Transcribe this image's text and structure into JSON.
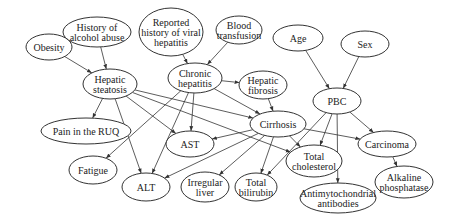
{
  "diagram": {
    "type": "bayesian-network",
    "nodes": [
      {
        "id": "alcohol",
        "lines": [
          "History of",
          "alcohol abuse"
        ],
        "cx": 97,
        "cy": 32,
        "rx": 34,
        "ry": 15
      },
      {
        "id": "obesity",
        "lines": [
          "Obesity"
        ],
        "cx": 49,
        "cy": 47,
        "rx": 23,
        "ry": 13
      },
      {
        "id": "viral",
        "lines": [
          "Reported",
          "history of viral",
          "hepatitis"
        ],
        "cx": 171,
        "cy": 32,
        "rx": 32,
        "ry": 24
      },
      {
        "id": "transfusion",
        "lines": [
          "Blood",
          "transfusion"
        ],
        "cx": 239,
        "cy": 30,
        "rx": 23,
        "ry": 14
      },
      {
        "id": "age",
        "lines": [
          "Age"
        ],
        "cx": 298,
        "cy": 38,
        "rx": 25,
        "ry": 13
      },
      {
        "id": "sex",
        "lines": [
          "Sex"
        ],
        "cx": 365,
        "cy": 44,
        "rx": 24,
        "ry": 13
      },
      {
        "id": "steatosis",
        "lines": [
          "Hepatic",
          "steatosis"
        ],
        "cx": 110,
        "cy": 84,
        "rx": 27,
        "ry": 15
      },
      {
        "id": "chronic",
        "lines": [
          "Chronic",
          "hepatitis"
        ],
        "cx": 195,
        "cy": 78,
        "rx": 27,
        "ry": 15
      },
      {
        "id": "fibrosis",
        "lines": [
          "Hepatic",
          "fibrosis"
        ],
        "cx": 263,
        "cy": 85,
        "rx": 24,
        "ry": 14
      },
      {
        "id": "pbc",
        "lines": [
          "PBC"
        ],
        "cx": 337,
        "cy": 101,
        "rx": 24,
        "ry": 13
      },
      {
        "id": "cirrhosis",
        "lines": [
          "Cirrhosis"
        ],
        "cx": 278,
        "cy": 124,
        "rx": 28,
        "ry": 13
      },
      {
        "id": "ruq",
        "lines": [
          "Pain in the RUQ"
        ],
        "cx": 86,
        "cy": 131,
        "rx": 45,
        "ry": 13
      },
      {
        "id": "ast",
        "lines": [
          "AST"
        ],
        "cx": 190,
        "cy": 144,
        "rx": 24,
        "ry": 13
      },
      {
        "id": "carcinoma",
        "lines": [
          "Carcinoma"
        ],
        "cx": 387,
        "cy": 144,
        "rx": 29,
        "ry": 13
      },
      {
        "id": "fatigue",
        "lines": [
          "Fatigue"
        ],
        "cx": 93,
        "cy": 170,
        "rx": 24,
        "ry": 14
      },
      {
        "id": "cholesterol",
        "lines": [
          "Total",
          "cholesterol"
        ],
        "cx": 314,
        "cy": 161,
        "rx": 28,
        "ry": 16
      },
      {
        "id": "alt",
        "lines": [
          "ALT"
        ],
        "cx": 146,
        "cy": 187,
        "rx": 24,
        "ry": 14
      },
      {
        "id": "irregular",
        "lines": [
          "Irregular",
          "liver"
        ],
        "cx": 205,
        "cy": 187,
        "rx": 24,
        "ry": 15
      },
      {
        "id": "bilirubin",
        "lines": [
          "Total",
          "bilirubin"
        ],
        "cx": 256,
        "cy": 187,
        "rx": 21,
        "ry": 14
      },
      {
        "id": "alkaline",
        "lines": [
          "Alkaline",
          "phosphatase"
        ],
        "cx": 404,
        "cy": 182,
        "rx": 29,
        "ry": 16
      },
      {
        "id": "antibodies",
        "lines": [
          "Antimytochondrial",
          "antibodies"
        ],
        "cx": 338,
        "cy": 198,
        "rx": 38,
        "ry": 15
      }
    ],
    "edges": [
      [
        "alcohol",
        "steatosis"
      ],
      [
        "obesity",
        "steatosis"
      ],
      [
        "viral",
        "chronic"
      ],
      [
        "transfusion",
        "chronic"
      ],
      [
        "age",
        "pbc"
      ],
      [
        "sex",
        "pbc"
      ],
      [
        "chronic",
        "fibrosis"
      ],
      [
        "fibrosis",
        "cirrhosis"
      ],
      [
        "steatosis",
        "ruq"
      ],
      [
        "steatosis",
        "alt"
      ],
      [
        "steatosis",
        "ast"
      ],
      [
        "steatosis",
        "cirrhosis"
      ],
      [
        "steatosis",
        "cholesterol"
      ],
      [
        "chronic",
        "fatigue"
      ],
      [
        "chronic",
        "alt"
      ],
      [
        "chronic",
        "ast"
      ],
      [
        "chronic",
        "cirrhosis"
      ],
      [
        "cirrhosis",
        "ast"
      ],
      [
        "cirrhosis",
        "alt"
      ],
      [
        "cirrhosis",
        "irregular"
      ],
      [
        "cirrhosis",
        "bilirubin"
      ],
      [
        "cirrhosis",
        "carcinoma"
      ],
      [
        "cirrhosis",
        "cholesterol"
      ],
      [
        "pbc",
        "cholesterol"
      ],
      [
        "pbc",
        "bilirubin"
      ],
      [
        "pbc",
        "antibodies"
      ],
      [
        "pbc",
        "carcinoma"
      ],
      [
        "carcinoma",
        "alkaline"
      ]
    ]
  }
}
